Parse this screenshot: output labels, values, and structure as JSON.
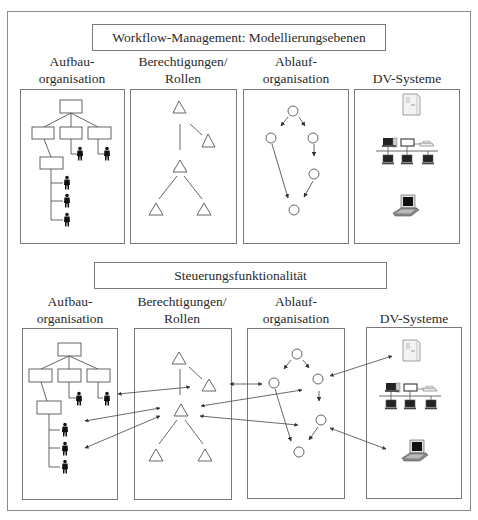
{
  "top": {
    "title": "Workflow-Management: Modellierungsebenen",
    "columns": [
      {
        "line1": "Aufbau-",
        "line2": "organisation"
      },
      {
        "line1": "Berechtigungen/",
        "line2": "Rollen"
      },
      {
        "line1": "Ablauf-",
        "line2": "organisation"
      },
      {
        "line1": "",
        "line2": "DV-Systeme"
      }
    ]
  },
  "bottom": {
    "title": "Steuerungsfunktionalität",
    "columns": [
      {
        "line1": "Aufbau-",
        "line2": "organisation"
      },
      {
        "line1": "Berechtigungen/",
        "line2": "Rollen"
      },
      {
        "line1": "Ablauf-",
        "line2": "organisation"
      },
      {
        "line1": "",
        "line2": "DV-Systeme"
      }
    ]
  },
  "icons": {
    "org_chart": "org-chart-icon",
    "person": "person-icon",
    "role_triangle": "role-triangle-icon",
    "process_node": "process-node-circle-icon",
    "server": "server-icon",
    "network": "network-icon",
    "laptop": "laptop-icon"
  },
  "colors": {
    "line": "#555555",
    "border": "#7a7a7a",
    "text": "#2a2a2a"
  }
}
